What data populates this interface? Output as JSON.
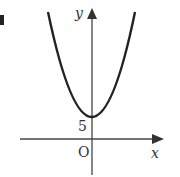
{
  "diagram": {
    "type": "parabola-graph",
    "axes": {
      "x_label": "x",
      "y_label": "y",
      "origin_label": "O"
    },
    "annotations": {
      "y_intercept_label": "5"
    },
    "colors": {
      "curve": "#222222",
      "axes": "#444444",
      "background": "#ffffff"
    }
  }
}
